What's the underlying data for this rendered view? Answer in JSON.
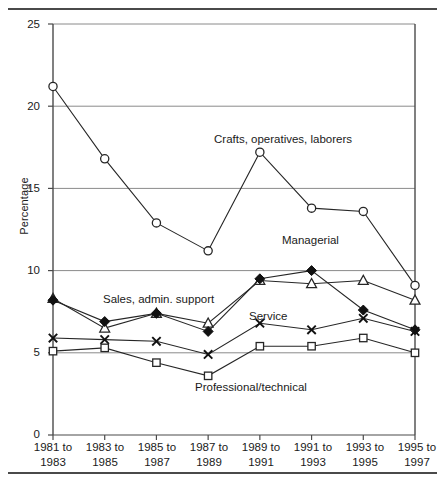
{
  "chart_data": {
    "type": "line",
    "title": "",
    "xlabel": "",
    "ylabel": "Percentage",
    "ylim": [
      0,
      25
    ],
    "yticks": [
      0,
      5,
      10,
      15,
      20,
      25
    ],
    "ytick_labels": [
      "0",
      "5",
      "10",
      "15",
      "20",
      "25"
    ],
    "grid": true,
    "grid_axis": "y",
    "legend": "inline-annotations",
    "categories": [
      "1981 to 1983",
      "1983 to 1985",
      "1985 to 1987",
      "1987 to 1989",
      "1989 to 1991",
      "1991 to 1993",
      "1993 to 1995",
      "1995 to 1997"
    ],
    "xtick_lines": [
      [
        "1981 to",
        "1983"
      ],
      [
        "1983 to",
        "1985"
      ],
      [
        "1985 to",
        "1987"
      ],
      [
        "1987 to",
        "1989"
      ],
      [
        "1989 to",
        "1991"
      ],
      [
        "1991 to",
        "1993"
      ],
      [
        "1993 to",
        "1995"
      ],
      [
        "1995 to",
        "1997"
      ]
    ],
    "series": [
      {
        "name": "Crafts, operatives, laborers",
        "marker": "open-circle",
        "values": [
          21.2,
          16.8,
          12.9,
          11.2,
          17.2,
          13.8,
          13.6,
          9.1
        ]
      },
      {
        "name": "Managerial",
        "marker": "open-triangle",
        "values": [
          8.3,
          6.5,
          7.4,
          6.8,
          9.4,
          9.2,
          9.4,
          8.2
        ]
      },
      {
        "name": "Sales, admin. support",
        "marker": "filled-diamond",
        "values": [
          8.2,
          6.9,
          7.4,
          6.3,
          9.5,
          10.0,
          7.6,
          6.4
        ]
      },
      {
        "name": "Service",
        "marker": "cross-x",
        "values": [
          5.9,
          5.8,
          5.7,
          4.9,
          6.8,
          6.4,
          7.1,
          6.3
        ]
      },
      {
        "name": "Professional/technical",
        "marker": "open-square",
        "values": [
          5.1,
          5.3,
          4.4,
          3.6,
          5.4,
          5.4,
          5.9,
          5.0
        ]
      }
    ],
    "annotations": [
      {
        "text": "Crafts, operatives, laborers",
        "x_px": 214,
        "y_px": 140
      },
      {
        "text": "Managerial",
        "x_px": 282,
        "y_px": 241
      },
      {
        "text": "Sales, admin. support",
        "x_px": 103,
        "y_px": 300
      },
      {
        "text": "Service",
        "x_px": 249,
        "y_px": 317
      },
      {
        "text": "Professional/technical",
        "x_px": 195,
        "y_px": 388
      }
    ],
    "colors": {
      "line": "#262626",
      "grid": "#8a8a8a",
      "axis": "#4a4a4a",
      "marker_fill_open": "#ffffff",
      "marker_fill_solid": "#111111",
      "text": "#1a1a1a",
      "rule": "#4a4a4a"
    }
  }
}
